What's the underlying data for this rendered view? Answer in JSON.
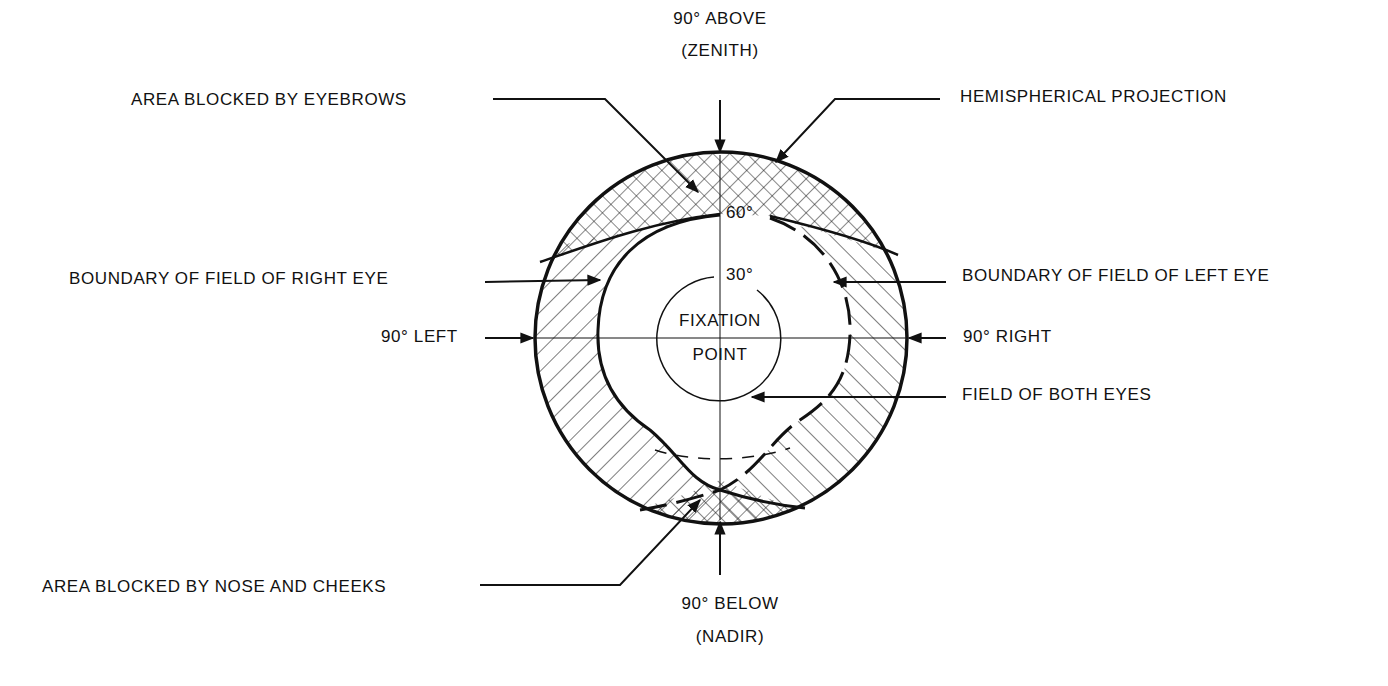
{
  "diagram": {
    "type": "binocular visual field on hemispherical projection",
    "labels": {
      "zenith_line1": "90° ABOVE",
      "zenith_line2": "(ZENITH)",
      "nadir_line1": "90° BELOW",
      "nadir_line2": "(NADIR)",
      "eyebrows": "AREA BLOCKED BY EYEBROWS",
      "hemispherical": "HEMISPHERICAL PROJECTION",
      "right_eye_boundary": "BOUNDARY OF FIELD OF RIGHT EYE",
      "left_eye_boundary": "BOUNDARY OF FIELD OF LEFT EYE",
      "left_90": "90° LEFT",
      "right_90": "90° RIGHT",
      "both_eyes": "FIELD OF BOTH EYES",
      "nose_cheeks": "AREA BLOCKED BY NOSE AND CHEEKS",
      "fixation_line1": "FIXATION",
      "fixation_line2": "POINT",
      "deg_60": "60°",
      "deg_30": "30°"
    },
    "colors": {
      "ink": "#111111",
      "background": "#ffffff"
    }
  }
}
